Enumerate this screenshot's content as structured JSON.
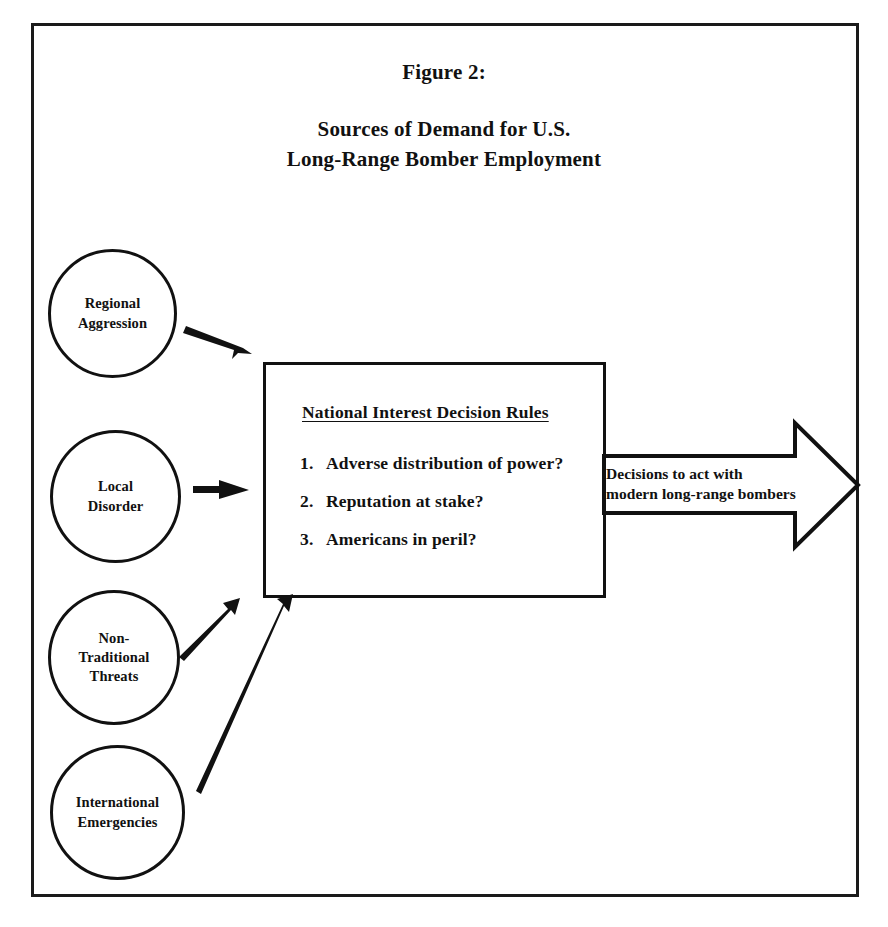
{
  "figure": {
    "label": "Figure 2:",
    "title_line_1": "Sources of Demand for U.S.",
    "title_line_2": "Long-Range Bomber Employment"
  },
  "sources": [
    {
      "id": "regional-aggression",
      "label": "Regional\nAggression"
    },
    {
      "id": "local-disorder",
      "label": "Local\nDisorder"
    },
    {
      "id": "non-traditional-threats",
      "label": "Non-\nTraditional\nThreats"
    },
    {
      "id": "international-emergencies",
      "label": "International\nEmergencies"
    }
  ],
  "decision_box": {
    "heading": "National Interest Decision Rules",
    "rules": [
      {
        "number": "1.",
        "text": "Adverse distribution of power?"
      },
      {
        "number": "2.",
        "text": "Reputation at stake?"
      },
      {
        "number": "3.",
        "text": "Americans in peril?"
      }
    ]
  },
  "outcome": {
    "line_1": "Decisions to act with",
    "line_2": "modern long-range bombers"
  },
  "colors": {
    "ink": "#111111",
    "background": "#ffffff"
  }
}
